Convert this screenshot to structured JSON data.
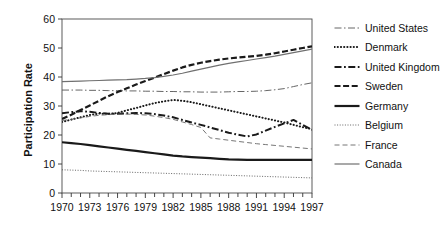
{
  "chart_data": {
    "type": "line",
    "title": "",
    "xlabel": "",
    "ylabel": "Participation Rate",
    "xlim": [
      1970,
      1997
    ],
    "ylim": [
      0,
      60
    ],
    "yticks": [
      0,
      10,
      20,
      30,
      40,
      50,
      60
    ],
    "xticks_major": [
      1970,
      1973,
      1976,
      1979,
      1982,
      1985,
      1988,
      1991,
      1994,
      1997
    ],
    "xticks_minor_every": 1,
    "grid": false,
    "legend_position": "right",
    "x": [
      1970,
      1971,
      1972,
      1973,
      1974,
      1975,
      1976,
      1977,
      1978,
      1979,
      1980,
      1981,
      1982,
      1983,
      1984,
      1985,
      1986,
      1987,
      1988,
      1989,
      1990,
      1991,
      1992,
      1993,
      1994,
      1995,
      1996,
      1997
    ],
    "series": [
      {
        "name": "United States",
        "style": "dash-dot-thin",
        "color": "#555555",
        "width": 0.9,
        "dash": "7,2.5,1.5,2.5",
        "values": [
          35.5,
          35.5,
          35.5,
          35.4,
          35.4,
          35.3,
          35.3,
          35.2,
          35.2,
          35.1,
          35.1,
          35.0,
          35.0,
          34.9,
          34.9,
          34.8,
          34.8,
          34.8,
          34.9,
          35.0,
          35.0,
          35.1,
          35.3,
          35.6,
          36.0,
          36.7,
          37.4,
          38.0
        ]
      },
      {
        "name": "Denmark",
        "style": "dotted-thick",
        "color": "#1a1a1a",
        "width": 2.0,
        "dash": "0.2,3",
        "values": [
          24.5,
          25.3,
          26.1,
          26.9,
          27.4,
          27.3,
          27.6,
          28.5,
          29.3,
          30.2,
          31.0,
          31.6,
          32.1,
          31.8,
          31.3,
          30.6,
          29.9,
          29.2,
          28.5,
          27.8,
          27.1,
          26.4,
          25.7,
          25.0,
          24.3,
          23.5,
          22.7,
          22.0
        ]
      },
      {
        "name": "United Kingdom",
        "style": "dash-dot-thick",
        "color": "#1a1a1a",
        "width": 2.0,
        "dash": "7,2.5,1.8,2.5",
        "values": [
          27.5,
          27.9,
          28.2,
          28.0,
          27.6,
          27.3,
          27.3,
          27.5,
          27.6,
          27.5,
          27.2,
          26.7,
          26.1,
          25.2,
          24.3,
          23.5,
          22.6,
          21.7,
          20.8,
          20.1,
          19.5,
          20.2,
          21.5,
          22.8,
          24.0,
          25.2,
          23.5,
          21.8
        ]
      },
      {
        "name": "Sweden",
        "style": "dashed-thick",
        "color": "#1a1a1a",
        "width": 2.2,
        "dash": "6,2.6",
        "values": [
          25.5,
          27.0,
          28.6,
          30.2,
          31.8,
          33.4,
          34.8,
          36.1,
          37.4,
          38.6,
          39.8,
          41.0,
          42.2,
          43.3,
          44.2,
          44.9,
          45.5,
          46.0,
          46.4,
          46.7,
          47.0,
          47.3,
          47.7,
          48.2,
          48.8,
          49.4,
          50.0,
          50.6
        ]
      },
      {
        "name": "Germany",
        "style": "solid-thick",
        "color": "#1a1a1a",
        "width": 2.2,
        "dash": "",
        "values": [
          17.5,
          17.2,
          16.9,
          16.5,
          16.1,
          15.7,
          15.3,
          14.9,
          14.5,
          14.1,
          13.7,
          13.3,
          12.9,
          12.6,
          12.4,
          12.2,
          12.0,
          11.8,
          11.6,
          11.5,
          11.4,
          11.4,
          11.4,
          11.4,
          11.4,
          11.4,
          11.4,
          11.4
        ]
      },
      {
        "name": "Belgium",
        "style": "dotted-thin",
        "color": "#555555",
        "width": 0.9,
        "dash": "1,1.6",
        "values": [
          8.0,
          7.9,
          7.8,
          7.6,
          7.5,
          7.4,
          7.3,
          7.2,
          7.1,
          7.0,
          6.9,
          6.8,
          6.7,
          6.6,
          6.5,
          6.4,
          6.3,
          6.2,
          6.1,
          6.0,
          5.9,
          5.8,
          5.7,
          5.6,
          5.5,
          5.4,
          5.3,
          5.2
        ]
      },
      {
        "name": "France",
        "style": "dashed-thin",
        "color": "#666666",
        "width": 0.9,
        "dash": "5,3",
        "values": [
          25.0,
          25.4,
          25.9,
          26.4,
          26.8,
          27.0,
          27.2,
          27.2,
          27.1,
          26.9,
          26.5,
          26.0,
          25.4,
          24.5,
          23.6,
          22.6,
          19.0,
          18.6,
          18.2,
          17.8,
          17.4,
          17.0,
          16.7,
          16.4,
          16.1,
          15.8,
          15.5,
          15.2
        ]
      },
      {
        "name": "Canada",
        "style": "solid-thin",
        "color": "#707070",
        "width": 1.2,
        "dash": "",
        "values": [
          38.4,
          38.5,
          38.6,
          38.7,
          38.8,
          38.9,
          39.0,
          39.1,
          39.3,
          39.5,
          39.8,
          40.2,
          40.7,
          41.3,
          42.0,
          42.7,
          43.4,
          44.1,
          44.7,
          45.2,
          45.7,
          46.2,
          46.7,
          47.2,
          47.8,
          48.4,
          49.0,
          49.6
        ]
      }
    ]
  },
  "axis": {
    "ylabel": "Participation Rate",
    "ytick_labels": [
      "0",
      "10",
      "20",
      "30",
      "40",
      "50",
      "60"
    ],
    "xtick_labels": [
      "1970",
      "1973",
      "1976",
      "1979",
      "1982",
      "1985",
      "1988",
      "1991",
      "1994",
      "1997"
    ]
  },
  "legend": {
    "items": [
      {
        "label": "United States"
      },
      {
        "label": "Denmark"
      },
      {
        "label": "United Kingdom"
      },
      {
        "label": "Sweden"
      },
      {
        "label": "Germany"
      },
      {
        "label": "Belgium"
      },
      {
        "label": "France"
      },
      {
        "label": "Canada"
      }
    ]
  }
}
